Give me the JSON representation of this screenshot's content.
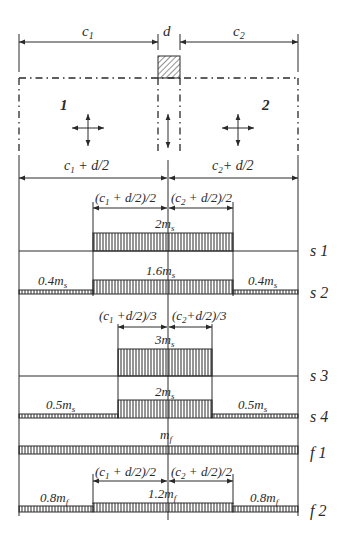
{
  "top_dimensions": {
    "c1": "c",
    "c1_sub": "1",
    "d": "d",
    "c2": "c",
    "c2_sub": "2"
  },
  "panels": {
    "left_label": "1",
    "right_label": "2"
  },
  "half_dimensions": {
    "left": {
      "main": "c",
      "sub": "1",
      "rest": " + d/2"
    },
    "right": {
      "main": "c",
      "sub": "2",
      "rest": "+ d/2"
    }
  },
  "strips": {
    "s1": {
      "row_label": "s 1",
      "dim_left": {
        "pre": "(c",
        "sub": "1",
        "rest": " + d/2)/2"
      },
      "dim_right": {
        "pre": "(c",
        "sub": "2",
        "rest": " + d/2)/2"
      },
      "center_value": {
        "main": "2m",
        "sub": "s"
      }
    },
    "s2": {
      "row_label": "s 2",
      "center_value": {
        "main": "1.6m",
        "sub": "s"
      },
      "left_value": {
        "main": "0.4m",
        "sub": "s"
      },
      "right_value": {
        "main": "0.4m",
        "sub": "s"
      }
    },
    "s3": {
      "row_label": "s 3",
      "dim_left": {
        "pre": "(c",
        "sub": "1",
        "rest": " +d/2)/3"
      },
      "dim_right": {
        "pre": "(c",
        "sub": "2",
        "rest": "+d/2)/3"
      },
      "center_value": {
        "main": "3m",
        "sub": "s"
      }
    },
    "s4": {
      "row_label": "s 4",
      "center_value": {
        "main": "2m",
        "sub": "s"
      },
      "left_value": {
        "main": "0.5m",
        "sub": "s"
      },
      "right_value": {
        "main": "0.5m",
        "sub": "s"
      }
    },
    "f1": {
      "row_label": "f 1",
      "center_value": {
        "main": "m",
        "sub": "f"
      }
    },
    "f2": {
      "row_label": "f 2",
      "dim_left": {
        "pre": "(c",
        "sub": "1",
        "rest": " + d/2)/2"
      },
      "dim_right": {
        "pre": "(c",
        "sub": "2",
        "rest": " + d/2)/2"
      },
      "center_value": {
        "main": "1.2m",
        "sub": "f"
      },
      "left_value": {
        "main": "0.8m",
        "sub": "f"
      },
      "right_value": {
        "main": "0.8m",
        "sub": "f"
      }
    }
  },
  "colors": {
    "ink": "#2a2a2a",
    "background": "#ffffff"
  }
}
